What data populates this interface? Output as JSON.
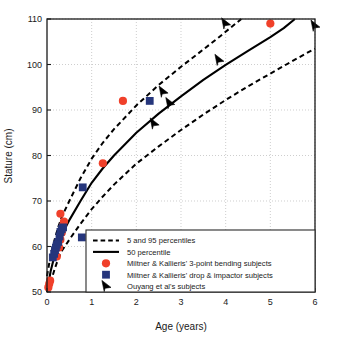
{
  "chart_data": {
    "type": "scatter",
    "title": "",
    "xlabel": "Age (years)",
    "ylabel": "Stature (cm)",
    "xlim": [
      0,
      6
    ],
    "ylim": [
      50,
      110
    ],
    "xticks": [
      "0",
      "1",
      "2",
      "3",
      "4",
      "5",
      "6"
    ],
    "yticks": [
      "50",
      "60",
      "70",
      "80",
      "90",
      "100",
      "110"
    ],
    "grid": true,
    "legend_position": "lower-right",
    "colors": {
      "circle_marker": "#F0402A",
      "square_marker": "#26367C",
      "arrow_marker": "#000000",
      "curve": "#000000",
      "grid": "#b9b9b9",
      "axis": "#1a1a1a"
    },
    "legend": [
      {
        "label": "5 and 95 percentiles",
        "marker": "dashed-line"
      },
      {
        "label": "50 percentile",
        "marker": "solid-line"
      },
      {
        "label": "Miltner & Kallieris' 3-point bending subjects",
        "marker": "circle"
      },
      {
        "label": "Miltner & Kallieris' drop & impactor subjects",
        "marker": "square"
      },
      {
        "label": "Ouyang et al's subjects",
        "marker": "arrow"
      }
    ],
    "series": [
      {
        "name": "5 percentile",
        "style": "dashed",
        "points": [
          [
            0.0,
            47.5
          ],
          [
            0.08,
            52.0
          ],
          [
            0.17,
            55.0
          ],
          [
            0.25,
            57.3
          ],
          [
            0.33,
            59.0
          ],
          [
            0.5,
            61.5
          ],
          [
            0.75,
            65.0
          ],
          [
            1.0,
            68.2
          ],
          [
            1.25,
            71.0
          ],
          [
            1.5,
            73.6
          ],
          [
            2.0,
            78.2
          ],
          [
            2.5,
            82.0
          ],
          [
            3.0,
            85.6
          ],
          [
            3.5,
            89.0
          ],
          [
            4.0,
            92.2
          ],
          [
            4.5,
            95.2
          ],
          [
            5.0,
            98.0
          ],
          [
            5.5,
            100.8
          ],
          [
            6.0,
            103.5
          ]
        ]
      },
      {
        "name": "50 percentile",
        "style": "solid",
        "points": [
          [
            0.0,
            50.0
          ],
          [
            0.08,
            54.5
          ],
          [
            0.17,
            58.0
          ],
          [
            0.25,
            60.5
          ],
          [
            0.33,
            62.5
          ],
          [
            0.5,
            65.8
          ],
          [
            0.75,
            70.0
          ],
          [
            1.0,
            74.0
          ],
          [
            1.25,
            77.2
          ],
          [
            1.5,
            80.0
          ],
          [
            2.0,
            85.0
          ],
          [
            2.5,
            89.2
          ],
          [
            3.0,
            93.0
          ],
          [
            3.5,
            96.6
          ],
          [
            4.0,
            99.9
          ],
          [
            4.5,
            103.0
          ],
          [
            5.0,
            106.0
          ],
          [
            5.3,
            108.0
          ],
          [
            5.55,
            110.0
          ]
        ]
      },
      {
        "name": "95 percentile",
        "style": "dashed",
        "points": [
          [
            0.0,
            53.5
          ],
          [
            0.08,
            58.0
          ],
          [
            0.17,
            61.5
          ],
          [
            0.25,
            64.2
          ],
          [
            0.33,
            66.5
          ],
          [
            0.5,
            70.0
          ],
          [
            0.75,
            75.0
          ],
          [
            1.0,
            79.3
          ],
          [
            1.25,
            82.8
          ],
          [
            1.5,
            85.8
          ],
          [
            2.0,
            91.0
          ],
          [
            2.5,
            95.5
          ],
          [
            3.0,
            99.5
          ],
          [
            3.5,
            103.3
          ],
          [
            3.85,
            106.0
          ],
          [
            4.1,
            108.0
          ],
          [
            4.35,
            110.0
          ]
        ]
      },
      {
        "name": "Miltner & Kallieris' 3-point bending subjects",
        "style": "circle",
        "points": [
          [
            0.03,
            51.0
          ],
          [
            0.05,
            51.8
          ],
          [
            0.07,
            52.5
          ],
          [
            0.22,
            57.8
          ],
          [
            0.27,
            59.8
          ],
          [
            0.3,
            61.5
          ],
          [
            0.33,
            63.0
          ],
          [
            0.36,
            64.6
          ],
          [
            0.38,
            65.5
          ],
          [
            0.3,
            67.2
          ],
          [
            1.25,
            78.3
          ],
          [
            1.7,
            92.0
          ],
          [
            5.0,
            109.0
          ]
        ]
      },
      {
        "name": "Miltner & Kallieris' drop & impactor subjects",
        "style": "square",
        "points": [
          [
            0.13,
            57.6
          ],
          [
            0.16,
            58.4
          ],
          [
            0.18,
            59.2
          ],
          [
            0.2,
            59.8
          ],
          [
            0.22,
            60.4
          ],
          [
            0.25,
            61.0
          ],
          [
            0.28,
            62.2
          ],
          [
            0.3,
            63.2
          ],
          [
            0.33,
            63.8
          ],
          [
            0.36,
            64.2
          ],
          [
            0.78,
            62.0
          ],
          [
            0.8,
            73.0
          ],
          [
            2.3,
            92.0
          ]
        ]
      },
      {
        "name": "Ouyang et al's subjects",
        "style": "arrow",
        "points": [
          [
            2.6,
            94.0
          ],
          [
            2.75,
            91.5
          ],
          [
            2.4,
            87.0
          ],
          [
            4.0,
            109.0
          ],
          [
            3.85,
            101.0
          ],
          [
            6.0,
            108.5
          ]
        ]
      }
    ]
  },
  "axes": {
    "x_label": "Age (years)",
    "y_label": "Stature (cm)"
  }
}
